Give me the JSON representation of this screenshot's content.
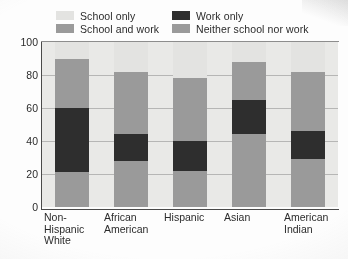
{
  "chart_data": {
    "type": "bar",
    "subtype": "stacked-bar-100",
    "title": "",
    "xlabel": "",
    "ylabel": "",
    "ylim": [
      0,
      100
    ],
    "yticks": [
      0,
      20,
      40,
      60,
      80,
      100
    ],
    "grid": true,
    "legend_position": "top",
    "categories": [
      "Non-\nHispanic\nWhite",
      "African\nAmerican",
      "Hispanic",
      "Asian",
      "American\nIndian"
    ],
    "series": [
      {
        "name": "School only",
        "color": "#e3e3e1",
        "values": [
          10,
          18,
          22,
          12,
          18
        ]
      },
      {
        "name": "School and work",
        "color": "#9a9a9a",
        "values": [
          30,
          38,
          38,
          23,
          36
        ]
      },
      {
        "name": "Work only",
        "color": "#2e2e2e",
        "values": [
          39,
          16,
          18,
          21,
          17
        ]
      },
      {
        "name": "Neither school nor work",
        "color": "#9a9a9a",
        "values": [
          21,
          28,
          22,
          44,
          29
        ]
      }
    ]
  },
  "legend": {
    "items": [
      {
        "label": "School only",
        "color": "#e3e3e1"
      },
      {
        "label": "Work only",
        "color": "#2e2e2e"
      },
      {
        "label": "School and work",
        "color": "#9a9a9a"
      },
      {
        "label": "Neither school nor work",
        "color": "#9a9a9a"
      }
    ]
  },
  "axis": {
    "y_labels": [
      "100",
      "80",
      "60",
      "40",
      "20",
      "0"
    ]
  },
  "colors": {
    "plot_background": "#e9e9e7",
    "grid": "#8d8d8d",
    "axis": "#4a4a4a",
    "text": "#2b2b2b"
  }
}
